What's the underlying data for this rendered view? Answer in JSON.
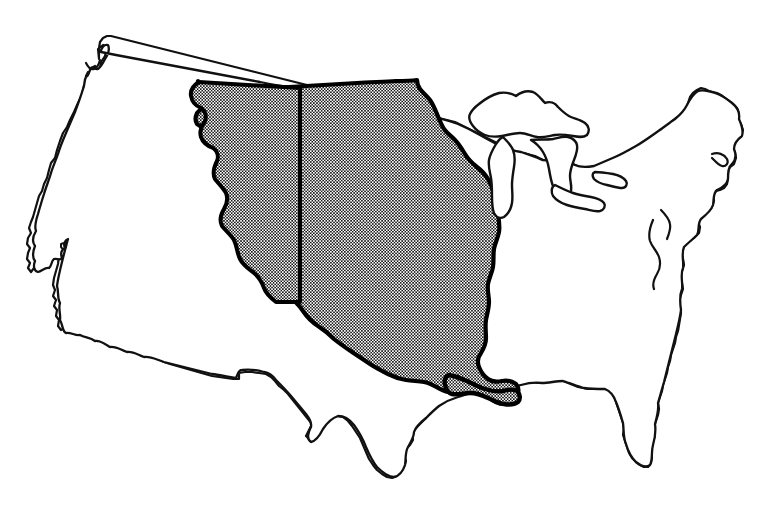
{
  "figure": {
    "subject": "Louisiana Purchase territory highlighted",
    "background_color": "#ffffff",
    "outline_color": "#111111",
    "highlight_fill": "halftone-dot-pattern",
    "highlight_dot_color": "#1a1a1a",
    "highlight_base_color": "#ffffff",
    "highlight_border_color": "#000000",
    "width": 782,
    "height": 512
  },
  "legend": {
    "shaded_region_label": "Shaded region",
    "unshaded_region_label": "Unshaded region"
  },
  "regions": [
    {
      "name": "contiguous-united-states-outline",
      "style": "outline",
      "stroke_width": 2.2
    },
    {
      "name": "louisiana-purchase-shaded-area",
      "style": "halftone-fill",
      "stroke_width": 4.0
    },
    {
      "name": "great-lakes",
      "style": "outline",
      "stroke_width": 2.2
    }
  ],
  "labels": {
    "none_visible": ""
  }
}
